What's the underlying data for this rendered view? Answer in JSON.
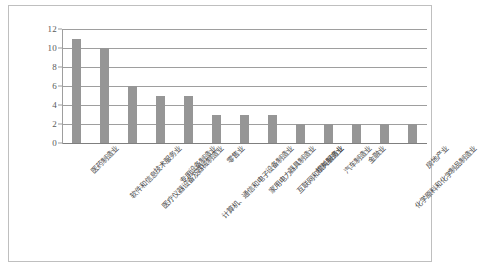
{
  "chart_data": {
    "type": "bar",
    "title": "",
    "subtitle": "",
    "xlabel": "",
    "ylabel": "",
    "ylim": [
      0,
      12
    ],
    "yticks": [
      "0",
      "2",
      "4",
      "6",
      "8",
      "10",
      "12"
    ],
    "grid": true,
    "legend": false,
    "legend_position": "none",
    "bar_color": "#969696",
    "gridline_color": "#9e9e9e",
    "axis_text_color": "#595959",
    "label_text_color": "#4a4a4a",
    "frame_color": "#bfbfbf",
    "background": "#ffffff",
    "label_rotation_deg": -45,
    "categories": [
      "医药制造业",
      "软件和信息技术服务业",
      "医疗仪器设备及器械制造业",
      "专用设备制造业",
      "计算机、通信和电子设备制造业",
      "零售业",
      "家用电力器具制造业",
      "互联网和相关服务业",
      "饮料制造业",
      "汽车制造业",
      "金融业",
      "化学原料和化学制品制造业",
      "房地产业"
    ],
    "values": [
      11,
      10,
      6,
      5,
      5,
      3,
      3,
      3,
      2,
      2,
      2,
      2,
      2
    ]
  }
}
